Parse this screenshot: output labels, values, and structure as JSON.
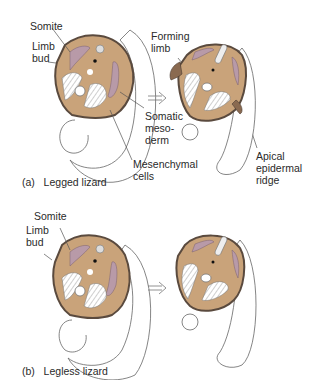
{
  "panels": [
    {
      "id": "a",
      "caption_letter": "(a)",
      "caption_text": "Legged lizard",
      "labels": {
        "somite": "Somite",
        "limb_bud": "Limb\nbud",
        "forming_limb": "Forming\nlimb",
        "somatic_mesoderm": "Somatic\nmeso-\nderm",
        "mesenchymal_cells": "Mesenchymal\ncells",
        "apical_epidermal_ridge": "Apical\nepidermal\nridge"
      }
    },
    {
      "id": "b",
      "caption_letter": "(b)",
      "caption_text": "Legless lizard",
      "labels": {
        "somite": "Somite",
        "limb_bud": "Limb\nbud"
      }
    }
  ],
  "colors": {
    "tissue": "#c9a37a",
    "tissue_outline": "#5a4a3e",
    "somite": "#b89aa8",
    "line": "#555555"
  }
}
